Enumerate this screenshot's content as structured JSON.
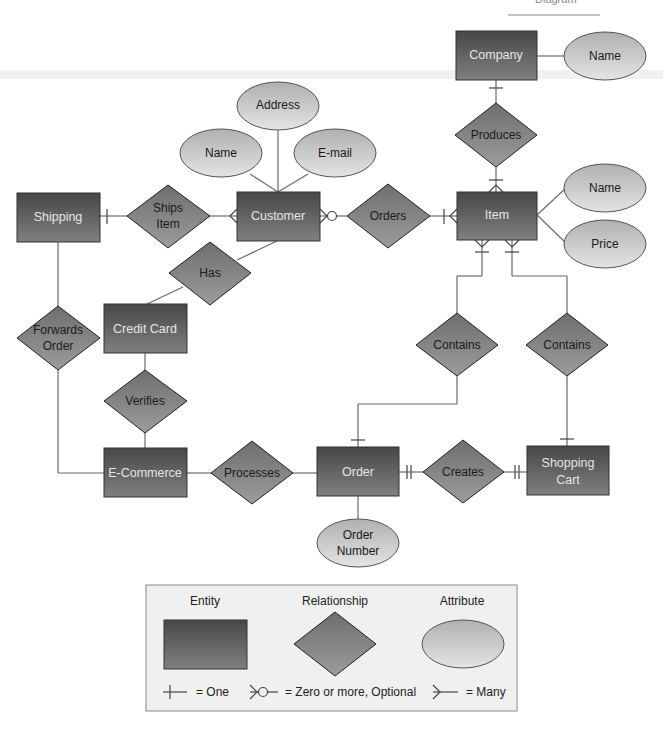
{
  "header": {
    "caption": "Diagram"
  },
  "entities": {
    "company": "Company",
    "item": "Item",
    "shipping": "Shipping",
    "customer": "Customer",
    "credit_card": "Credit Card",
    "ecommerce": "E-Commerce",
    "order": "Order",
    "shopping_cart_l1": "Shopping",
    "shopping_cart_l2": "Cart"
  },
  "relationships": {
    "produces": "Produces",
    "ships_item_l1": "Ships",
    "ships_item_l2": "Item",
    "orders": "Orders",
    "has": "Has",
    "forwards_order_l1": "Forwards",
    "forwards_order_l2": "Order",
    "verifies": "Verifies",
    "contains_order": "Contains",
    "contains_cart": "Contains",
    "processes": "Processes",
    "creates": "Creates"
  },
  "attributes": {
    "company_name": "Name",
    "customer_address": "Address",
    "customer_name": "Name",
    "customer_email": "E-mail",
    "item_name": "Name",
    "item_price": "Price",
    "order_number_l1": "Order",
    "order_number_l2": "Number"
  },
  "legend": {
    "entity": "Entity",
    "relationship": "Relationship",
    "attribute": "Attribute",
    "one": "= One",
    "zero_or_more": "= Zero or more, Optional",
    "many": "= Many"
  },
  "colors": {
    "entity_top": "#4a4a4a",
    "entity_bottom": "#7a7a7a",
    "relationship": "#808080",
    "attribute_top": "#b8b8b8",
    "attribute_bottom": "#e2e2e2",
    "legend_bg": "#f0f0f0"
  }
}
